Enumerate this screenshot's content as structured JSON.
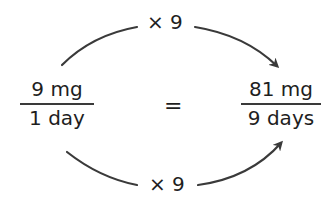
{
  "diagram": {
    "left_fraction": {
      "numerator": "9 mg",
      "denominator": "1 day"
    },
    "equals": "=",
    "right_fraction": {
      "numerator": "81 mg",
      "denominator": "9 days"
    },
    "top_arrow": {
      "label": "× 9"
    },
    "bottom_arrow": {
      "label": "× 9"
    },
    "colors": {
      "text": "#1e1e1e",
      "arrow": "#3a3a3a",
      "background": "#ffffff"
    }
  }
}
